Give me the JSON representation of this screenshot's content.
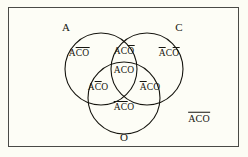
{
  "figure": {
    "type": "venn-diagram-3-set",
    "background_color": "#fcfcf4",
    "panel_color": "#fdfdf6",
    "ink_color": "#16150f",
    "frame_color": "#4a4a46"
  },
  "sets": [
    {
      "id": "A",
      "label": "A",
      "position": "top-left",
      "cx": 101,
      "cy": 69,
      "r": 36
    },
    {
      "id": "C",
      "label": "C",
      "position": "top-right",
      "cx": 147,
      "cy": 69,
      "r": 36
    },
    {
      "id": "O",
      "label": "O",
      "position": "bottom",
      "cx": 124,
      "cy": 98,
      "r": 36
    }
  ],
  "set_labels": [
    {
      "name": "set-label-a",
      "text": "A",
      "x": 66,
      "y": 27
    },
    {
      "name": "set-label-c",
      "text": "C",
      "x": 179,
      "y": 27
    },
    {
      "name": "set-label-o",
      "text": "O",
      "x": 124,
      "y": 137
    }
  ],
  "regions": [
    {
      "name": "region-a-only",
      "description": "A only",
      "x": 79,
      "y": 52,
      "segments": [
        {
          "text": "A",
          "overline": false
        },
        {
          "text": "CO",
          "overline": true
        }
      ]
    },
    {
      "name": "region-a-and-c",
      "description": "A and C, not O",
      "x": 124,
      "y": 50,
      "segments": [
        {
          "text": "AC",
          "overline": false
        },
        {
          "text": "O",
          "overline": true
        }
      ]
    },
    {
      "name": "region-c-only",
      "description": "C only",
      "x": 169,
      "y": 52,
      "segments": [
        {
          "text": "A",
          "overline": true
        },
        {
          "text": "C",
          "overline": false
        },
        {
          "text": "O",
          "overline": true
        }
      ]
    },
    {
      "name": "region-a-and-c-and-o",
      "description": "A and C and O",
      "x": 124,
      "y": 69,
      "segments": [
        {
          "text": "ACO",
          "overline": false
        }
      ]
    },
    {
      "name": "region-a-and-o",
      "description": "A and O, not C",
      "x": 98,
      "y": 86,
      "segments": [
        {
          "text": "A",
          "overline": false
        },
        {
          "text": "C",
          "overline": true
        },
        {
          "text": "O",
          "overline": false
        }
      ]
    },
    {
      "name": "region-c-and-o",
      "description": "C and O, not A",
      "x": 150,
      "y": 86,
      "segments": [
        {
          "text": "A",
          "overline": true
        },
        {
          "text": "CO",
          "overline": false
        }
      ]
    },
    {
      "name": "region-o-only",
      "description": "O only",
      "x": 124,
      "y": 106,
      "segments": [
        {
          "text": "AC",
          "overline": true
        },
        {
          "text": "O",
          "overline": false
        }
      ]
    }
  ],
  "outside": {
    "name": "region-complement",
    "description": "outside all three sets",
    "x": 199,
    "y": 117,
    "segments": [
      {
        "text": "ACO",
        "overline": true
      }
    ]
  }
}
